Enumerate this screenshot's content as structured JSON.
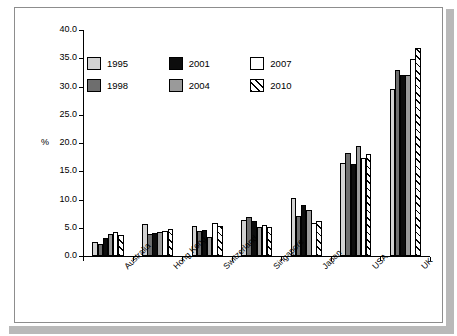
{
  "chart_data": {
    "type": "bar",
    "title": "",
    "subtitle": "",
    "xlabel": "",
    "ylabel": "%",
    "ylim": [
      0,
      40
    ],
    "ytick_step": 5,
    "ytick_labels": [
      "0.0",
      "5.0",
      "10.0",
      "15.0",
      "20.0",
      "25.0",
      "30.0",
      "35.0",
      "40.0"
    ],
    "grid": false,
    "legend_position": "top-left",
    "categories": [
      "Australia",
      "Hong Kong",
      "Switzerland",
      "Singapore",
      "Japan",
      "USA",
      "UK"
    ],
    "series": [
      {
        "name": "1995",
        "color": "#d2d2d2",
        "pattern": "solid",
        "values": [
          2.4,
          5.6,
          5.3,
          6.4,
          10.2,
          16.4,
          29.5
        ]
      },
      {
        "name": "1998",
        "color": "#6e6e6e",
        "pattern": "solid",
        "values": [
          2.1,
          3.9,
          4.4,
          6.9,
          7.1,
          18.3,
          32.9
        ]
      },
      {
        "name": "2001",
        "color": "#0d0d0d",
        "pattern": "solid",
        "values": [
          3.2,
          4.0,
          4.6,
          6.2,
          9.0,
          16.2,
          32.1
        ]
      },
      {
        "name": "2004",
        "color": "#9a9a9a",
        "pattern": "solid",
        "values": [
          3.9,
          4.2,
          3.3,
          5.1,
          8.1,
          19.4,
          32.1
        ]
      },
      {
        "name": "2007",
        "color": "#ffffff",
        "pattern": "solid",
        "values": [
          4.2,
          4.4,
          5.9,
          5.5,
          5.9,
          17.4,
          34.9
        ]
      },
      {
        "name": "2010",
        "color": "#ffffff",
        "pattern": "hatch",
        "values": [
          3.7,
          4.7,
          5.3,
          5.2,
          6.2,
          18.1,
          36.9
        ]
      }
    ]
  },
  "legend": {
    "items": [
      {
        "label": "1995",
        "swatch": "light-gray"
      },
      {
        "label": "1998",
        "swatch": "dark-gray"
      },
      {
        "label": "2001",
        "swatch": "black"
      },
      {
        "label": "2004",
        "swatch": "medium-gray"
      },
      {
        "label": "2007",
        "swatch": "white"
      },
      {
        "label": "2010",
        "swatch": "diagonal-hatch"
      }
    ]
  },
  "axes": {
    "y_title": "%"
  },
  "icons": {
    "legend_swatch": "square-swatch-icon"
  }
}
